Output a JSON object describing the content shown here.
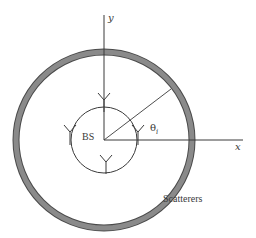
{
  "diagram": {
    "type": "circular-scatterer-model",
    "labels": {
      "y_axis": "y",
      "x_axis": "x",
      "base_station": "BS",
      "angle": "θ",
      "angle_subscript": "i",
      "scatterer_ring": "Scatterers"
    },
    "colors": {
      "ring_fill": "#7a7a7a",
      "ring_edge": "#4a4a4a",
      "line": "#3a3a3a",
      "background": "#ffffff"
    },
    "geometry": {
      "center": [
        104,
        140
      ],
      "scatterer_ring_radius": 88,
      "scatterer_ring_thickness": 6,
      "antenna_array_radius": 33,
      "angle_line_deg": 40,
      "antenna_count": 4
    }
  }
}
